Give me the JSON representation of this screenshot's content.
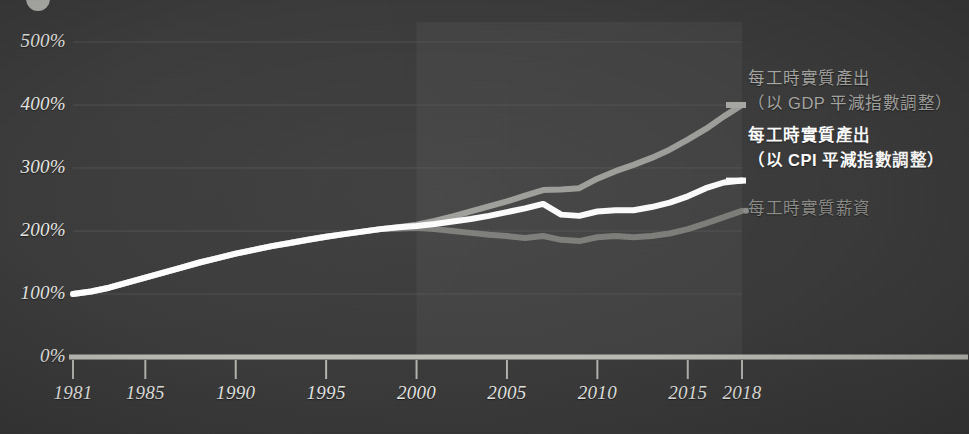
{
  "figure": {
    "background_color": "#3a3a3a",
    "highlight_panel_color": "#424242"
  },
  "chart_data": {
    "type": "line",
    "title": "",
    "subtitle": "",
    "xlabel": "",
    "ylabel": "",
    "grid": true,
    "legend_position": "right",
    "xlim": [
      1981,
      2018
    ],
    "ylim": [
      0,
      500
    ],
    "x_ticks": [
      1981,
      1985,
      1990,
      1995,
      2000,
      2005,
      2010,
      2015,
      2018
    ],
    "x_tick_labels": [
      "1981",
      "1985",
      "1990",
      "1995",
      "2000",
      "2005",
      "2010",
      "2015",
      "2018"
    ],
    "y_ticks": [
      0,
      100,
      200,
      300,
      400,
      500
    ],
    "y_tick_labels": [
      "0%",
      "100%",
      "200%",
      "300%",
      "400%",
      "500%"
    ],
    "highlight_span": [
      2000,
      2018
    ],
    "series": [
      {
        "name": "每工時實質產出（以 GDP 平減指數調整）",
        "name_line1": "每工時實質產出",
        "name_line2": "（以 GDP 平減指數調整）",
        "color": "#9e9e9a",
        "x": [
          1981,
          1982,
          1983,
          1984,
          1985,
          1986,
          1987,
          1988,
          1989,
          1990,
          1991,
          1992,
          1993,
          1994,
          1995,
          1996,
          1997,
          1998,
          1999,
          2000,
          2001,
          2002,
          2003,
          2004,
          2005,
          2006,
          2007,
          2008,
          2009,
          2010,
          2011,
          2012,
          2013,
          2014,
          2015,
          2016,
          2017,
          2018
        ],
        "values": [
          100,
          104,
          110,
          118,
          126,
          134,
          142,
          150,
          157,
          164,
          170,
          176,
          181,
          186,
          191,
          195,
          199,
          203,
          206,
          210,
          216,
          223,
          231,
          239,
          247,
          256,
          265,
          266,
          268,
          283,
          295,
          305,
          316,
          329,
          345,
          362,
          382,
          400
        ]
      },
      {
        "name": "每工時實質產出（以 CPI 平減指數調整）",
        "name_line1": "每工時實質產出",
        "name_line2": "（以 CPI 平減指數調整）",
        "color": "#ffffff",
        "x": [
          1981,
          1982,
          1983,
          1984,
          1985,
          1986,
          1987,
          1988,
          1989,
          1990,
          1991,
          1992,
          1993,
          1994,
          1995,
          1996,
          1997,
          1998,
          1999,
          2000,
          2001,
          2002,
          2003,
          2004,
          2005,
          2006,
          2007,
          2008,
          2009,
          2010,
          2011,
          2012,
          2013,
          2014,
          2015,
          2016,
          2017,
          2018
        ],
        "values": [
          100,
          104,
          110,
          118,
          126,
          134,
          142,
          150,
          157,
          164,
          170,
          176,
          181,
          186,
          191,
          195,
          199,
          203,
          206,
          208,
          211,
          215,
          219,
          224,
          230,
          236,
          243,
          226,
          224,
          231,
          233,
          233,
          238,
          245,
          255,
          268,
          277,
          280
        ]
      },
      {
        "name": "每工時實質薪資",
        "name_line1": "每工時實質薪資",
        "name_line2": "",
        "color": "#7d7d7a",
        "x": [
          1981,
          1982,
          1983,
          1984,
          1985,
          1986,
          1987,
          1988,
          1989,
          1990,
          1991,
          1992,
          1993,
          1994,
          1995,
          1996,
          1997,
          1998,
          1999,
          2000,
          2001,
          2002,
          2003,
          2004,
          2005,
          2006,
          2007,
          2008,
          2009,
          2010,
          2011,
          2012,
          2013,
          2014,
          2015,
          2016,
          2017,
          2018
        ],
        "values": [
          100,
          104,
          110,
          118,
          126,
          134,
          142,
          150,
          157,
          164,
          170,
          176,
          181,
          186,
          191,
          195,
          199,
          203,
          204,
          205,
          203,
          200,
          197,
          194,
          192,
          189,
          192,
          186,
          184,
          190,
          192,
          190,
          192,
          196,
          203,
          212,
          222,
          232
        ]
      }
    ],
    "baseline_axis_value": 0
  },
  "legend": {
    "entries": [
      {
        "label_line1": "每工時實質產出",
        "label_line2": "（以 GDP 平減指數調整）",
        "color": "#a8a8a4",
        "marker": "line",
        "emphasis": "normal"
      },
      {
        "label_line1": "每工時實質產出",
        "label_line2": "（以 CPI 平減指數調整）",
        "color": "#ffffff",
        "marker": "line",
        "emphasis": "bold"
      },
      {
        "label_line1": "每工時實質薪資",
        "label_line2": "",
        "color": "#8d8d8a",
        "marker": "dot",
        "emphasis": "normal"
      }
    ]
  }
}
